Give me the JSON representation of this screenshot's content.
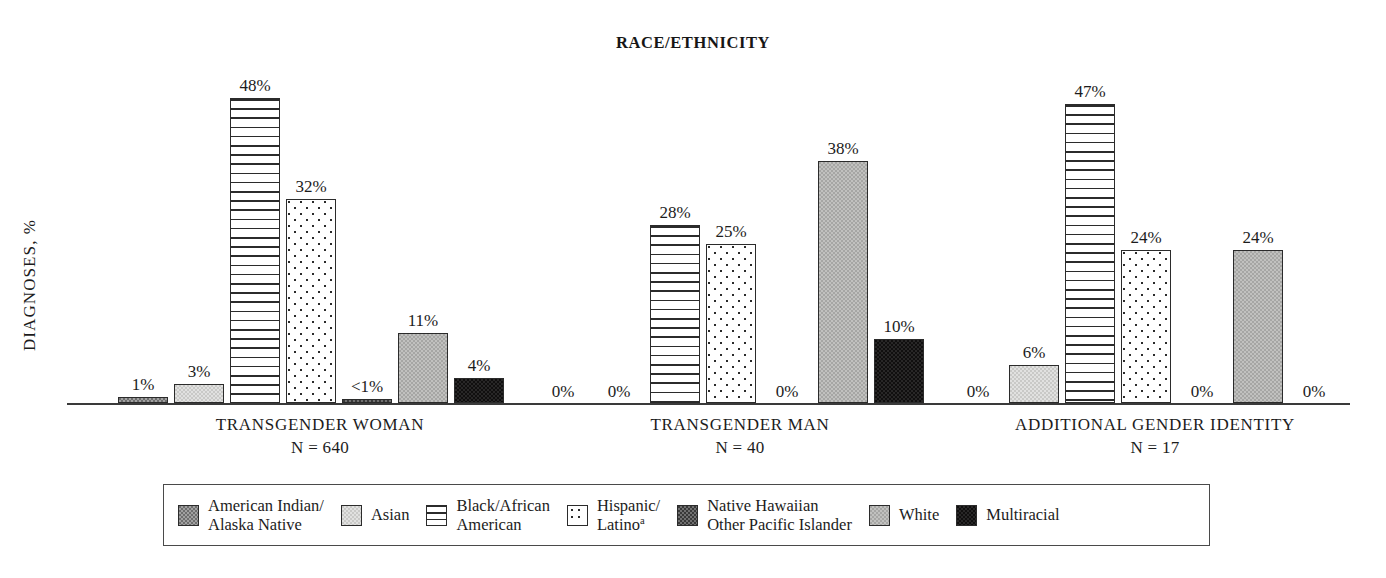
{
  "chart_data": {
    "type": "bar",
    "title": "RACE/ETHNICITY",
    "xlabel": "",
    "ylabel": "DIAGNOSES, %",
    "ylim": [
      0,
      52
    ],
    "grid": false,
    "legend_position": "bottom",
    "categories": [
      "TRANSGENDER WOMAN",
      "TRANSGENDER MAN",
      "ADDITIONAL GENDER IDENTITY"
    ],
    "category_subtitles": [
      "N = 640",
      "N = 40",
      "N = 17"
    ],
    "series": [
      {
        "name": "American Indian/Alaska Native",
        "key": "aian",
        "values": [
          1,
          0,
          0
        ],
        "labels": [
          "1%",
          "0%",
          "0%"
        ]
      },
      {
        "name": "Asian",
        "key": "asian",
        "values": [
          3,
          0,
          6
        ],
        "labels": [
          "3%",
          "0%",
          "6%"
        ]
      },
      {
        "name": "Black/African American",
        "key": "black",
        "values": [
          48,
          28,
          47
        ],
        "labels": [
          "48%",
          "28%",
          "47%"
        ]
      },
      {
        "name": "Hispanic/Latino",
        "key": "hisp",
        "values": [
          32,
          25,
          24
        ],
        "labels": [
          "32%",
          "25%",
          "24%"
        ]
      },
      {
        "name": "Native Hawaiian Other Pacific Islander",
        "key": "nhopi",
        "values": [
          0.4,
          0,
          0
        ],
        "labels": [
          "<1%",
          "0%",
          "0%"
        ]
      },
      {
        "name": "White",
        "key": "white",
        "values": [
          11,
          38,
          24
        ],
        "labels": [
          "11%",
          "38%",
          "24%"
        ]
      },
      {
        "name": "Multiracial",
        "key": "multi",
        "values": [
          4,
          10,
          0
        ],
        "labels": [
          "4%",
          "10%",
          "0%"
        ]
      }
    ]
  },
  "title": "RACE/ETHNICITY",
  "y_axis": {
    "label": "DIAGNOSES, %"
  },
  "groups": [
    {
      "name": "TRANSGENDER WOMAN",
      "n": "N = 640"
    },
    {
      "name": "TRANSGENDER MAN",
      "n": "N = 40"
    },
    {
      "name": "ADDITIONAL GENDER IDENTITY",
      "n": "N = 17"
    }
  ],
  "bars": {
    "g0": [
      "1%",
      "3%",
      "48%",
      "32%",
      "<1%",
      "11%",
      "4%"
    ],
    "g1": [
      "0%",
      "0%",
      "28%",
      "25%",
      "0%",
      "38%",
      "10%"
    ],
    "g2": [
      "0%",
      "6%",
      "47%",
      "24%",
      "0%",
      "24%",
      "0%"
    ]
  },
  "legend": [
    {
      "line1": "American Indian/",
      "line2": "Alaska Native",
      "sup": ""
    },
    {
      "line1": "Asian",
      "line2": "",
      "sup": ""
    },
    {
      "line1": "Black/African",
      "line2": "American",
      "sup": ""
    },
    {
      "line1": "Hispanic/",
      "line2": "Latino",
      "sup": "a"
    },
    {
      "line1": "Native Hawaiian",
      "line2": "Other Pacific Islander",
      "sup": ""
    },
    {
      "line1": "White",
      "line2": "",
      "sup": ""
    },
    {
      "line1": "Multiracial",
      "line2": "",
      "sup": ""
    }
  ],
  "colors": {
    "axis": "#3a3a3a",
    "text": "#1c1c1c",
    "aian": "#6e6e6e",
    "asian": "#c9c9c7",
    "nhopi": "#393939",
    "white_series": "#a6a6a4",
    "multi": "#100f0f"
  }
}
